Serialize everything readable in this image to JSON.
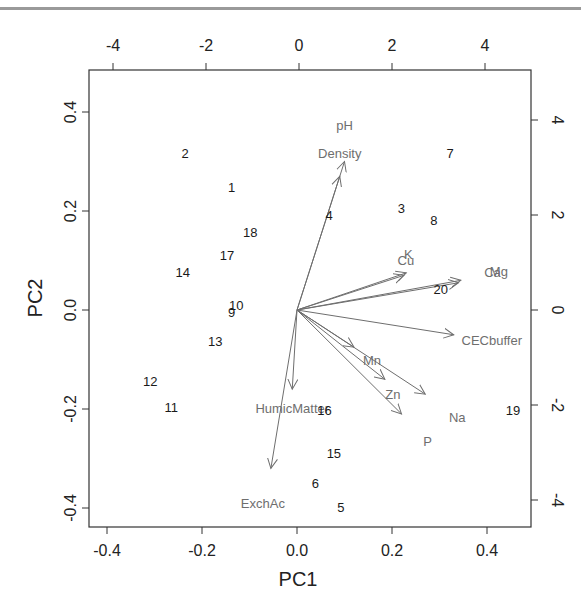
{
  "chart_data": {
    "type": "scatter",
    "subtype": "biplot",
    "title": "",
    "xlabel": "PC1",
    "ylabel": "PC2",
    "primary_axes": {
      "x_ticks": [
        "-0.4",
        "-0.2",
        "0.0",
        "0.2",
        "0.4"
      ],
      "y_ticks": [
        "-0.4",
        "-0.2",
        "0.0",
        "0.2",
        "0.4"
      ],
      "xlim": [
        -0.44,
        0.49
      ],
      "ylim": [
        -0.44,
        0.48
      ]
    },
    "secondary_axes": {
      "x_ticks": [
        "-4",
        "-2",
        "0",
        "2",
        "4"
      ],
      "y_ticks": [
        "-4",
        "-2",
        "0",
        "2",
        "4"
      ],
      "xlim": [
        -4.5,
        4.9
      ],
      "ylim": [
        -4.5,
        5.0
      ]
    },
    "grid": false,
    "observations": [
      {
        "label": "1",
        "x": -1.45,
        "y": 2.6
      },
      {
        "label": "2",
        "x": -2.45,
        "y": 3.3
      },
      {
        "label": "3",
        "x": 2.2,
        "y": 2.15
      },
      {
        "label": "4",
        "x": 0.65,
        "y": 2.0
      },
      {
        "label": "5",
        "x": 0.9,
        "y": -4.15
      },
      {
        "label": "6",
        "x": 0.35,
        "y": -3.65
      },
      {
        "label": "7",
        "x": 3.25,
        "y": 3.3
      },
      {
        "label": "8",
        "x": 2.9,
        "y": 1.9
      },
      {
        "label": "9",
        "x": -1.45,
        "y": -0.05
      },
      {
        "label": "10",
        "x": -1.35,
        "y": 0.1
      },
      {
        "label": "11",
        "x": -2.75,
        "y": -2.05
      },
      {
        "label": "12",
        "x": -3.2,
        "y": -1.5
      },
      {
        "label": "13",
        "x": -1.8,
        "y": -0.65
      },
      {
        "label": "14",
        "x": -2.5,
        "y": 0.8
      },
      {
        "label": "15",
        "x": 0.75,
        "y": -3.0
      },
      {
        "label": "16",
        "x": 0.55,
        "y": -2.1
      },
      {
        "label": "17",
        "x": -1.55,
        "y": 1.15
      },
      {
        "label": "18",
        "x": -1.05,
        "y": 1.65
      },
      {
        "label": "19",
        "x": 4.6,
        "y": -2.1
      },
      {
        "label": "20",
        "x": 3.05,
        "y": 0.45
      }
    ],
    "loadings": [
      {
        "label": "pH",
        "x": 0.1,
        "y": 0.3
      },
      {
        "label": "Density",
        "x": 0.09,
        "y": 0.27
      },
      {
        "label": "K",
        "x": 0.23,
        "y": 0.075
      },
      {
        "label": "Cu",
        "x": 0.225,
        "y": 0.07
      },
      {
        "label": "Ca",
        "x": 0.34,
        "y": 0.055
      },
      {
        "label": "Mg",
        "x": 0.345,
        "y": 0.06
      },
      {
        "label": "CECbuffer",
        "x": 0.33,
        "y": -0.05
      },
      {
        "label": "Mn",
        "x": 0.12,
        "y": -0.075
      },
      {
        "label": "Zn",
        "x": 0.185,
        "y": -0.14
      },
      {
        "label": "Na",
        "x": 0.27,
        "y": -0.17
      },
      {
        "label": "P",
        "x": 0.22,
        "y": -0.21
      },
      {
        "label": "HumicMatter",
        "x": -0.01,
        "y": -0.16
      },
      {
        "label": "ExchAc",
        "x": -0.055,
        "y": -0.32
      }
    ]
  },
  "axes": {
    "bottom": {
      "title": "PC1",
      "ticks": [
        "-0.4",
        "-0.2",
        "0.0",
        "0.2",
        "0.4"
      ]
    },
    "left": {
      "title": "PC2",
      "ticks": [
        "0.4",
        "0.2",
        "0.0",
        "-0.2",
        "-0.4"
      ]
    },
    "top": {
      "ticks": [
        "-4",
        "-2",
        "0",
        "2",
        "4"
      ]
    },
    "right": {
      "ticks": [
        "4",
        "2",
        "0",
        "-2",
        "-4"
      ]
    }
  },
  "colors": {
    "observation_text": "#1a1a1a",
    "loading_arrow": "#6e6e6e",
    "loading_text": "#6e6e6e",
    "frame": "#333333"
  }
}
